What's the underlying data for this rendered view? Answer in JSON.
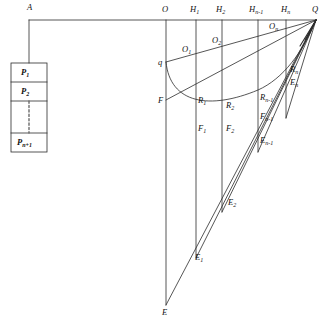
{
  "figure": {
    "type": "geometric-diagram",
    "width": 325,
    "height": 330,
    "background_color": "#ffffff",
    "line_color": "#2b2b2b",
    "dashed_color": "#6a6a6a"
  },
  "array_box": {
    "pointer_label": "A",
    "cells": [
      {
        "label": "P",
        "sub": "1"
      },
      {
        "label": "P",
        "sub": "2"
      },
      {
        "label": "",
        "sub": ""
      },
      {
        "label": "P",
        "sub": "n+1"
      }
    ]
  },
  "top_axis": {
    "points": [
      {
        "label": "O",
        "sub": ""
      },
      {
        "label": "H",
        "sub": "1"
      },
      {
        "label": "H",
        "sub": "2"
      },
      {
        "label": "H",
        "sub": "n-1"
      },
      {
        "label": "H",
        "sub": "n"
      },
      {
        "label": "Q",
        "sub": ""
      }
    ]
  },
  "vertex_labels": {
    "q": "q",
    "F": "F",
    "E": "E"
  },
  "o_labels": [
    {
      "label": "O",
      "sub": "1"
    },
    {
      "label": "O",
      "sub": "2"
    },
    {
      "label": "O",
      "sub": "n"
    }
  ],
  "r_labels": [
    {
      "label": "R",
      "sub": "1"
    },
    {
      "label": "R",
      "sub": "2"
    },
    {
      "label": "R",
      "sub": "n-1"
    },
    {
      "label": "R",
      "sub": "n"
    }
  ],
  "f_labels": [
    {
      "label": "F",
      "sub": "1"
    },
    {
      "label": "F",
      "sub": "2"
    },
    {
      "label": "F",
      "sub": "n-1"
    }
  ],
  "e_labels": [
    {
      "label": "E",
      "sub": "1"
    },
    {
      "label": "E",
      "sub": "2"
    },
    {
      "label": "E",
      "sub": "n-1"
    },
    {
      "label": "E",
      "sub": "n"
    }
  ],
  "labels_flat": {
    "A": "A",
    "O": "O",
    "Q": "Q",
    "q": "q",
    "F": "F",
    "E": "E",
    "H1": "H",
    "H1s": "1",
    "H2": "H",
    "H2s": "2",
    "Hnm1": "H",
    "Hnm1s": "n-1",
    "Hn": "H",
    "Hns": "n",
    "O1": "O",
    "O1s": "1",
    "O2": "O",
    "O2s": "2",
    "On": "O",
    "Ons": "n",
    "R1": "R",
    "R1s": "1",
    "R2": "R",
    "R2s": "2",
    "Rnm1": "R",
    "Rnm1s": "n-1",
    "Rn": "R",
    "Rns": "n",
    "F1": "F",
    "F1s": "1",
    "F2": "F",
    "F2s": "2",
    "Fnm1": "F",
    "Fnm1s": "n-1",
    "E1": "E",
    "E1s": "1",
    "E2": "E",
    "E2s": "2",
    "Enm1": "E",
    "Enm1s": "n-1",
    "En": "E",
    "Ens": "n",
    "P1": "P",
    "P1s": "1",
    "P2": "P",
    "P2s": "2",
    "Pn1": "P",
    "Pn1s": "n+1"
  }
}
